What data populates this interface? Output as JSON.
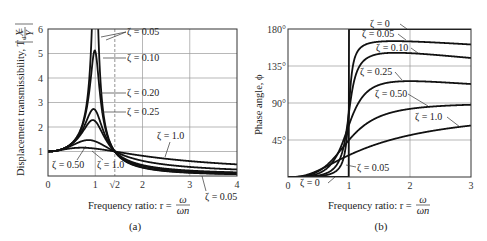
{
  "chart_data": [
    {
      "id": "a",
      "type": "line",
      "caption": "(a)",
      "xlabel": "Frequency ratio: r = ω/ωn",
      "xlabel_prefix": "Frequency ratio: r =",
      "xlabel_num": "ω",
      "xlabel_den": "ωn",
      "ylabel": "Displacement transmissibility, Td = |X/Y|",
      "ylabel_text": "Displacement transmissibility, T",
      "ylabel_sub": "d",
      "ylabel_eq": " = ",
      "ylabel_num": "X",
      "ylabel_den": "Y",
      "xlim": [
        0,
        4
      ],
      "ylim": [
        0,
        6
      ],
      "xticks": [
        {
          "value": 0,
          "label": "0"
        },
        {
          "value": 1,
          "label": "1"
        },
        {
          "value": 1.4142,
          "label": "√2"
        },
        {
          "value": 2,
          "label": "2"
        },
        {
          "value": 3,
          "label": "3"
        },
        {
          "value": 4,
          "label": "4"
        }
      ],
      "yticks": [
        {
          "value": 1,
          "label": "1"
        },
        {
          "value": 2,
          "label": "2"
        },
        {
          "value": 3,
          "label": "3"
        },
        {
          "value": 4,
          "label": "4"
        },
        {
          "value": 5,
          "label": "5"
        },
        {
          "value": 6,
          "label": "6"
        }
      ],
      "grid": true,
      "reference_line": {
        "x": 1.4142,
        "style": "dashed"
      },
      "formula": "Td = sqrt((1+(2ζr)^2)/((1-r^2)^2+(2ζr)^2))",
      "series": [
        {
          "name": "ζ = 0.05",
          "zeta": 0.05,
          "peak": 10.05
        },
        {
          "name": "ζ = 0.10",
          "zeta": 0.1,
          "peak": 5.1
        },
        {
          "name": "ζ = 0.20",
          "zeta": 0.2,
          "peak": 2.7
        },
        {
          "name": "ζ = 0.25",
          "zeta": 0.25,
          "peak": 2.3
        },
        {
          "name": "ζ = 0.50",
          "zeta": 0.5,
          "peak": 1.4
        },
        {
          "name": "ζ = 1.0",
          "zeta": 1.0,
          "peak": 1.15
        }
      ],
      "annotations": [
        {
          "text": "ζ = 0.05",
          "target": "peak-sides"
        },
        {
          "text": "ζ = 0.10",
          "target": "peak"
        },
        {
          "text": "ζ = 0.20",
          "target": "peak"
        },
        {
          "text": "ζ = 0.25",
          "target": "peak"
        },
        {
          "text": "ζ = 1.0",
          "target": "tail"
        },
        {
          "text": "ζ = 0.50",
          "target": "low-peak"
        },
        {
          "text": "ζ = 1.0",
          "target": "low-peak"
        },
        {
          "text": "ζ = 0.05",
          "target": "tail"
        }
      ]
    },
    {
      "id": "b",
      "type": "line",
      "caption": "(b)",
      "xlabel": "Frequency ratio: r = ω/ωn",
      "xlabel_prefix": "Frequency ratio: r =",
      "xlabel_num": "ω",
      "xlabel_den": "ωn",
      "ylabel": "Phase angle, ϕ",
      "xlim": [
        0,
        3
      ],
      "ylim": [
        0,
        180
      ],
      "xticks": [
        {
          "value": 0,
          "label": "0"
        },
        {
          "value": 1,
          "label": "1"
        },
        {
          "value": 2,
          "label": "2"
        },
        {
          "value": 3,
          "label": "3"
        }
      ],
      "yticks": [
        {
          "value": 45,
          "label": "45°"
        },
        {
          "value": 90,
          "label": "90°"
        },
        {
          "value": 135,
          "label": "135°"
        },
        {
          "value": 180,
          "label": "180°"
        }
      ],
      "grid": true,
      "formula": "ϕ = atan2(2ζr^3, 1 - r^2 + (2ζr)^2)",
      "series": [
        {
          "name": "ζ = 0",
          "zeta": 0.0
        },
        {
          "name": "ζ = 0.05",
          "zeta": 0.05
        },
        {
          "name": "ζ = 0.10",
          "zeta": 0.1
        },
        {
          "name": "ζ = 0.25",
          "zeta": 0.25
        },
        {
          "name": "ζ = 0.50",
          "zeta": 0.5
        },
        {
          "name": "ζ = 1.0",
          "zeta": 1.0
        }
      ],
      "annotations": [
        {
          "text": "ζ = 0",
          "target": "top"
        },
        {
          "text": "ζ = 0.05",
          "target": "upper"
        },
        {
          "text": "ζ = 0.10",
          "target": "upper"
        },
        {
          "text": "ζ = 0.25",
          "target": "upper"
        },
        {
          "text": "ζ = 0.50",
          "target": "mid"
        },
        {
          "text": "ζ = 1.0",
          "target": "mid"
        },
        {
          "text": "ζ = 0.05",
          "target": "low"
        },
        {
          "text": "ζ = 0",
          "target": "bottom"
        }
      ]
    }
  ]
}
